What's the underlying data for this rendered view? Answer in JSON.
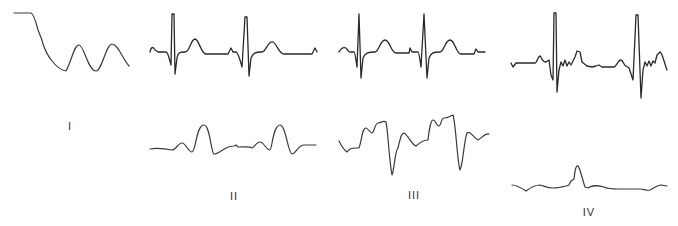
{
  "figure": {
    "panels": [
      {
        "id": "I",
        "label": "I",
        "description": "Initial flat segment, steep descent, then two smooth oscillations"
      },
      {
        "id": "II",
        "label": "II",
        "description": "Top: normal ECG-like trace with two QRS complexes; bottom: smooth slow waveform with two large peaks"
      },
      {
        "id": "III",
        "label": "III",
        "description": "Top: ECG-like trace with two sharp QRS complexes; bottom: irregular waveform with two deep troughs"
      },
      {
        "id": "IV",
        "label": "IV",
        "description": "Top: ECG trace with two QRS complexes and high-frequency noise; bottom: low-amplitude trace with single peak"
      }
    ]
  },
  "colors": {
    "background": "#ffffff",
    "trace": "#2a2a2a",
    "label": "#333333"
  }
}
